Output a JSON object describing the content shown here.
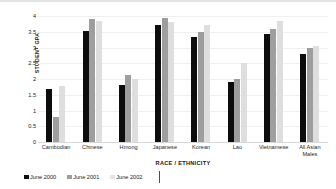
{
  "chart_data": {
    "type": "bar",
    "title": "",
    "xlabel": "RACE / ETHNICITY",
    "ylabel": "STUDENT GPA",
    "ylim": [
      0,
      4
    ],
    "ytick_labels": [
      "4",
      "3.5",
      "3",
      "2.5",
      "2",
      "1.5",
      "1",
      "0.5",
      "0"
    ],
    "ytick_values": [
      4,
      3.5,
      3,
      2.5,
      2,
      1.5,
      1,
      0.5,
      0
    ],
    "grid": true,
    "legend_position": "bottom-left",
    "categories": [
      "Cambodian",
      "Chinese",
      "Hmong",
      "Japanese",
      "Korean",
      "Lao",
      "Vietnamese",
      "All Asian\nMales"
    ],
    "series": [
      {
        "name": "June 2000",
        "color": "#0d0d0d",
        "values": [
          1.68,
          3.53,
          1.8,
          3.71,
          3.32,
          1.9,
          3.42,
          2.78
        ]
      },
      {
        "name": "June 2001",
        "color": "#9e9e9e",
        "values": [
          0.79,
          3.9,
          2.13,
          3.94,
          3.5,
          2.0,
          3.6,
          2.98
        ]
      },
      {
        "name": "June 2002",
        "color": "#dedede",
        "values": [
          1.78,
          3.83,
          2.0,
          3.8,
          3.73,
          2.5,
          3.83,
          3.05
        ]
      }
    ]
  }
}
